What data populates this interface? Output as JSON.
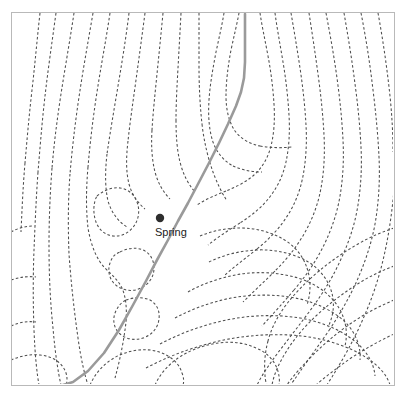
{
  "map": {
    "type": "topographic-contour-map",
    "title": "",
    "background_color": "#ffffff",
    "frame": {
      "x": 11,
      "y": 12,
      "width": 383,
      "height": 373,
      "stroke_color": "#b9b9b9"
    },
    "contours": {
      "style": "dashed",
      "color": "#4d4d4d",
      "dash_pattern": "2.6 2.2",
      "stroke_width": 1.05,
      "count": 54,
      "interval_label": ""
    },
    "trail": {
      "name": "trail",
      "color": "#9a9a9a",
      "stroke_width": 2.6,
      "path": "M 245 14 L 245 62 L 244 78 L 241 92 L 236 106 L 228 124 L 219 143 L 209 163 L 198 184 L 188 203 L 178 221 L 168 240 L 157 260 L 146 281 L 133 305 L 119 330 L 104 353 L 88 371 L 73 382 L 63 385"
    },
    "markers": [
      {
        "name": "spring",
        "label": "Spring",
        "x": 160,
        "y": 218,
        "radius": 4.2,
        "color": "#2e2e2e",
        "label_x": 155,
        "label_y": 236,
        "label_color": "#1a1a1a"
      }
    ],
    "contour_paths": [
      "M 40 13 C 37 40, 35 64, 32 90 C 29 116, 27 140, 25 163",
      "M 25 163 C 23 186, 22 210, 21 232",
      "M 56 13 C 52 42, 48 70, 45 96 C 42 122, 40 148, 38 172",
      "M 38 172 C 36 200, 35 226, 34 250 C 33 276, 33 302, 34 330 C 35 356, 37 374, 39 385",
      "M 74 13 C 70 40, 65 68, 61 94 C 57 120, 54 144, 52 168",
      "M 52 168 C 50 194, 49 220, 49 245 C 49 272, 50 300, 53 328 C 55 352, 58 372, 61 385",
      "M 93 13 C 88 42, 83 70, 79 97 C 75 124, 72 150, 70 174",
      "M 70 174 C 68 200, 68 228, 69 254 C 71 282, 74 310, 78 338 C 81 360, 85 376, 88 385",
      "M 110 13 C 106 40, 101 66, 97 92 C 93 118, 90 143, 88 167",
      "M 88 167 C 86 190, 86 210, 88 228 C 91 246, 97 260, 105 268 C 112 275, 118 280, 122 288 C 126 297, 127 309, 126 322 C 124 340, 120 360, 115 378",
      "M 129 13 C 126 38, 122 62, 118 86 C 114 110, 110 133, 107 154",
      "M 107 154 C 105 172, 105 188, 108 201 C 112 214, 119 222, 127 227",
      "M 145 13 C 142 36, 139 58, 136 80 C 133 102, 130 122, 128 141",
      "M 128 141 C 126 158, 126 172, 129 184 C 132 195, 138 203, 145 209",
      "M 163 13 C 161 34, 159 54, 157 74 C 155 94, 153 113, 152 130",
      "M 152 130 C 151 146, 152 160, 155 172 C 158 183, 163 192, 170 199",
      "M 181 13 C 180 32, 179 50, 178 68 C 177 86, 176 104, 176 120",
      "M 176 120 C 176 136, 177 150, 180 162 C 183 174, 188 184, 195 192",
      "M 199 13 C 199 30, 199 48, 199 66 C 199 86, 200 106, 202 124",
      "M 202 124 C 204 142, 208 158, 213 172 C 217 183, 222 193, 227 201",
      "M 224 13 C 222 25, 219 38, 216 52 C 213 68, 210 84, 209 100 C 208 116, 209 130, 213 142 C 217 153, 224 161, 233 166",
      "M 233 166 C 242 170, 252 172, 262 172",
      "M 239 13 C 237 24, 234 36, 231 50 C 228 66, 226 82, 226 96 C 226 110, 229 122, 235 131 C 241 139, 250 144, 260 146",
      "M 260 146 C 271 148, 282 148, 292 147",
      "M 260 13 C 262 26, 265 40, 268 56 C 271 72, 273 88, 274 104 C 275 120, 274 134, 271 146 C 268 158, 262 168, 254 175 C 246 182, 236 187, 226 191",
      "M 226 191 C 216 195, 206 199, 197 205",
      "M 275 13 C 277 28, 280 44, 283 62 C 286 80, 288 98, 289 115 C 290 132, 289 148, 286 162 C 283 176, 277 188, 269 198 C 261 208, 251 216, 240 223",
      "M 240 223 C 229 230, 218 237, 208 245",
      "M 291 13 C 294 30, 297 48, 300 68 C 303 88, 305 107, 306 125 C 307 143, 306 160, 303 176 C 300 192, 294 206, 286 218 C 278 230, 268 240, 257 249",
      "M 257 249 C 246 258, 235 266, 225 275",
      "M 309 13 C 312 32, 315 52, 318 74 C 321 96, 323 116, 324 135 C 325 154, 324 172, 321 188 C 318 205, 312 220, 304 234 C 296 248, 286 260, 275 271",
      "M 275 271 C 264 282, 253 292, 243 302",
      "M 326 13 C 330 34, 334 56, 337 78 C 340 100, 342 120, 343 140 C 344 160, 343 178, 340 196 C 337 214, 331 231, 323 247 C 315 263, 305 277, 294 290",
      "M 294 290 C 283 303, 272 315, 262 326",
      "M 344 13 C 348 36, 352 60, 355 84 C 358 106, 360 127, 361 147 C 362 167, 361 186, 358 205 C 355 224, 349 242, 341 259 C 333 277, 323 293, 312 308",
      "M 312 308 C 301 323, 290 337, 280 350 C 271 362, 263 373, 257 385",
      "M 361 13 C 366 38, 370 64, 373 90 C 376 114, 378 136, 379 157 C 380 178, 379 198, 376 218 C 373 238, 367 257, 359 276 C 351 295, 341 312, 330 329",
      "M 330 329 C 319 345, 308 360, 299 373 C 295 379, 292 383, 290 385",
      "M 378 13 C 383 40, 387 68, 390 96 C 392 116, 393 134, 393 152",
      "M 394 190 C 392 212, 389 234, 384 256 C 379 278, 372 299, 363 319 C 354 340, 343 359, 332 377 C 330 380, 328 383, 327 385",
      "M 11 232 C 18 228, 26 226, 34 226",
      "M 11 280 C 20 277, 28 276, 36 277",
      "M 11 326 C 20 322, 28 321, 36 322",
      "M 97 196 C 104 190, 112 187, 120 188 C 128 189, 134 194, 137 202 C 140 210, 139 219, 134 226 C 129 233, 121 237, 113 236 C 105 235, 99 230, 96 222 C 93 214, 93 203, 97 196",
      "M 120 252 C 128 248, 136 247, 143 250 C 150 253, 154 260, 154 268 C 154 277, 149 284, 141 288 C 133 292, 124 291, 117 286 C 110 281, 107 272, 110 263 C 112 257, 115 254, 120 252",
      "M 126 300 C 134 297, 143 297, 150 300 C 157 304, 160 311, 159 319 C 158 328, 152 335, 143 338 C 134 341, 125 339, 119 333 C 113 327, 112 317, 117 309 C 119 305, 122 302, 126 300",
      "M 11 360 C 20 356, 30 354, 40 355 C 50 356, 58 360, 63 367 C 67 373, 68 379, 66 385",
      "M 90 385 C 94 376, 100 368, 108 362 C 117 355, 128 351, 139 350 C 150 349, 160 351, 168 356 C 175 360, 180 366, 182 373 C 184 378, 184 382, 183 385",
      "M 155 385 C 160 374, 168 365, 178 358 C 190 350, 204 345, 218 343 C 232 341, 245 343, 256 348 C 266 352, 273 359, 277 368 C 279 374, 280 380, 279 385",
      "M 394 228 C 382 232, 370 237, 358 244 C 344 252, 331 261, 319 271 C 306 282, 295 293, 286 305 C 277 317, 271 329, 268 341",
      "M 268 341 C 265 352, 264 364, 265 375 C 265 379, 266 383, 267 385",
      "M 394 266 C 381 271, 368 277, 356 285 C 342 294, 329 304, 317 315 C 304 327, 294 339, 286 352 C 279 363, 274 374, 272 385",
      "M 394 300 C 380 306, 366 313, 353 322 C 338 332, 325 343, 313 355 C 302 366, 293 376, 287 385",
      "M 394 334 C 379 341, 365 349, 351 358 C 337 368, 325 377, 316 385",
      "M 200 236 C 212 231, 226 228, 240 228 C 256 228, 271 232, 283 239 C 295 246, 303 256, 307 268",
      "M 307 268 C 311 280, 311 293, 307 305",
      "M 209 262 C 223 255, 239 251, 256 250 C 274 249, 291 253, 305 260 C 318 267, 327 278, 331 290 C 335 302, 334 315, 328 327",
      "M 188 292 C 204 283, 222 277, 241 274 C 262 271, 283 273, 301 279 C 318 285, 331 295, 339 308 C 346 320, 348 333, 345 346",
      "M 175 318 C 192 309, 211 302, 231 298 C 254 294, 278 294, 300 299 C 320 304, 337 313, 348 325 C 357 336, 361 348, 360 360",
      "M 160 344 C 179 334, 200 326, 222 321 C 248 315, 275 314, 300 318 C 323 322, 343 331, 357 343 C 368 353, 374 364, 375 376",
      "M 146 368 C 167 357, 190 348, 215 342 C 244 335, 274 333, 302 336 C 327 339, 350 347, 367 358 C 379 366, 387 375, 390 385"
    ]
  }
}
